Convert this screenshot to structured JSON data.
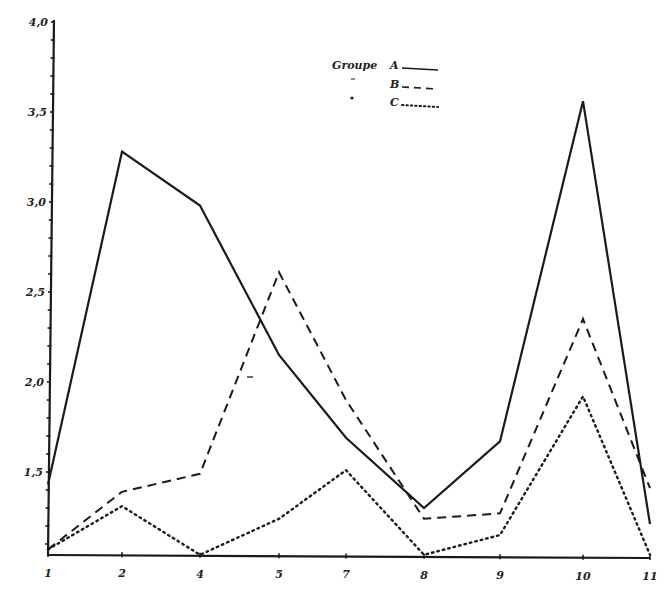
{
  "chart_data": {
    "type": "line",
    "title": "",
    "xlabel": "",
    "ylabel": "",
    "categories": [
      "1",
      "2",
      "4",
      "5",
      "7",
      "8",
      "9",
      "10",
      "11"
    ],
    "x_tick_labels": [
      "1",
      "2",
      "4",
      "5",
      "7",
      "8",
      "9",
      "10",
      "11"
    ],
    "y_tick_labels": [
      "1,5",
      "2,0",
      "2,5",
      "3,0",
      "3,5",
      "4,0"
    ],
    "y_ticks": [
      1.5,
      2.0,
      2.5,
      3.0,
      3.5,
      4.0
    ],
    "ylim": [
      1.04,
      4.0
    ],
    "grid": false,
    "legend_position": "top-center",
    "legend_title": "Groupe",
    "series": [
      {
        "name": "A",
        "style": "solid",
        "values": [
          1.43,
          3.28,
          2.98,
          2.15,
          1.69,
          1.3,
          1.67,
          3.56,
          1.21
        ]
      },
      {
        "name": "B",
        "style": "dashed",
        "values": [
          1.07,
          1.39,
          1.49,
          2.61,
          1.9,
          1.24,
          1.27,
          2.35,
          1.41
        ]
      },
      {
        "name": "C",
        "style": "dotted",
        "values": [
          1.07,
          1.31,
          1.04,
          1.24,
          1.51,
          1.04,
          1.15,
          1.92,
          1.04
        ]
      }
    ]
  },
  "legend": {
    "title": "Groupe",
    "items": [
      {
        "label": "A",
        "style": "solid"
      },
      {
        "label": "B",
        "style": "dashed"
      },
      {
        "label": "C",
        "style": "dotted"
      }
    ]
  },
  "colors": {
    "ink": "#1a1a1a",
    "background": "#ffffff"
  }
}
